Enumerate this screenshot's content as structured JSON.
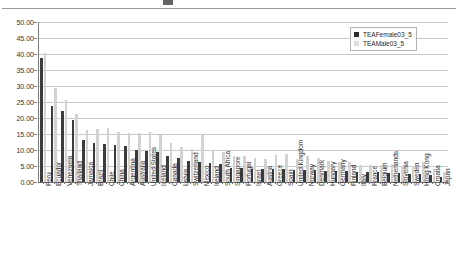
{
  "chart_data": {
    "type": "bar",
    "title": "",
    "xlabel": "",
    "ylabel": "",
    "ylim": [
      0,
      50
    ],
    "ytick_step": 5,
    "ytick_labels": [
      "50.00",
      "45.00",
      "40.00",
      "35.00",
      "30.00",
      "25.00",
      "20.00",
      "15.00",
      "10.00",
      "5.00",
      "0.00"
    ],
    "grid": true,
    "legend_position": "top-right",
    "categories": [
      "Peru",
      "Ecuador",
      "Venezuela",
      "Thailand",
      "Jamaica",
      "Brazil",
      "Chile",
      "China",
      "Argentina",
      "Australia",
      "United States",
      "Iceland",
      "Canada",
      "Latvia",
      "Switzerland",
      "Mexico",
      "Ireland",
      "South Africa",
      "Singapore",
      "Portugal",
      "Israel",
      "Austria",
      "Greece",
      "Spain",
      "United Kingdom",
      "Norway",
      "Denmark",
      "Hungary",
      "Germany",
      "Finland",
      "Italy",
      "France",
      "Belgium",
      "Netherlands",
      "Slovenia",
      "Sweden",
      "Hong Kong",
      "Croatia",
      "Japan"
    ],
    "series": [
      {
        "name": "TEAFemale03_5",
        "color": "#3b3b3b",
        "values": [
          38.7,
          23.6,
          22.3,
          19.4,
          13.0,
          12.3,
          12.0,
          11.6,
          11.4,
          10.0,
          9.6,
          9.3,
          8.2,
          7.5,
          6.5,
          6.3,
          5.9,
          5.6,
          4.4,
          4.3,
          4.2,
          4.1,
          4.0,
          4.0,
          3.9,
          3.8,
          3.6,
          3.5,
          3.4,
          3.3,
          3.2,
          3.1,
          3.0,
          2.9,
          2.8,
          2.6,
          2.4,
          2.2,
          1.6
        ]
      },
      {
        "name": "TEAMale03_5",
        "color": "#d2d2d2",
        "values": [
          40.2,
          29.5,
          25.7,
          21.3,
          16.2,
          16.5,
          17.0,
          15.6,
          15.3,
          15.4,
          15.5,
          14.6,
          12.3,
          11.0,
          10.3,
          14.8,
          10.1,
          9.4,
          8.1,
          8.0,
          7.6,
          7.3,
          8.3,
          8.6,
          7.1,
          8.2,
          7.4,
          6.6,
          6.4,
          6.2,
          5.4,
          5.3,
          5.2,
          5.6,
          5.0,
          4.9,
          6.3,
          4.0,
          3.1
        ]
      }
    ]
  },
  "legend": {
    "items": [
      {
        "label": "TEAFemale03_5"
      },
      {
        "label": "TEAMale03_5"
      }
    ]
  }
}
